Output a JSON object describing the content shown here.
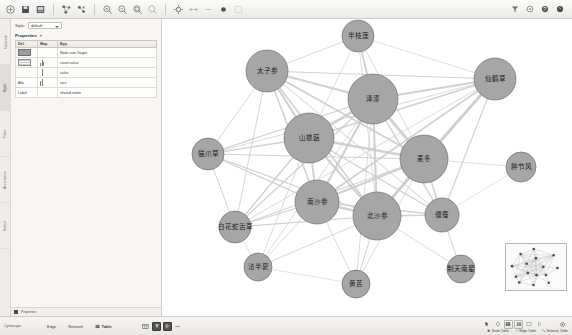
{
  "app": {
    "title": "Cytoscape Network View",
    "background": "#ffffff",
    "node_fill": "#a6a6a6",
    "node_stroke": "#6f6f6f",
    "edge_color": "#c9c9c9"
  },
  "toolbar": {
    "groups": [
      {
        "name": "file",
        "buttons": [
          {
            "icon": "open-network-icon",
            "label": "Open"
          },
          {
            "icon": "save-session-icon",
            "label": "Save Session"
          },
          {
            "icon": "export-image-icon",
            "label": "Export Image"
          }
        ]
      },
      {
        "name": "layout",
        "buttons": [
          {
            "icon": "apply-layout-icon",
            "label": "Apply Layout"
          },
          {
            "icon": "layout-settings-icon",
            "label": "Layout Settings"
          }
        ]
      },
      {
        "name": "zoom",
        "buttons": [
          {
            "icon": "zoom-in-icon",
            "label": "Zoom In"
          },
          {
            "icon": "zoom-out-icon",
            "label": "Zoom Out"
          },
          {
            "icon": "zoom-fit-icon",
            "label": "Fit Network"
          },
          {
            "icon": "zoom-selected-icon",
            "label": "Zoom Selected"
          }
        ]
      },
      {
        "name": "select",
        "buttons": [
          {
            "icon": "select-mode-icon",
            "label": "Select Mode"
          },
          {
            "icon": "hide-selected-icon",
            "label": "Hide Selected"
          },
          {
            "icon": "show-all-icon",
            "label": "Show All"
          },
          {
            "icon": "delete-selected-icon",
            "label": "Delete Selected"
          },
          {
            "icon": "group-nodes-icon",
            "label": "Group Nodes"
          }
        ]
      }
    ],
    "right_buttons": [
      {
        "icon": "filter-icon",
        "label": "Filter"
      },
      {
        "icon": "annotation-icon",
        "label": "Annotation"
      },
      {
        "icon": "help-icon",
        "label": "Help"
      },
      {
        "icon": "app-store-icon",
        "label": "App Store"
      }
    ]
  },
  "left_panel": {
    "vertical_tabs": [
      {
        "label": "Network",
        "selected": false
      },
      {
        "label": "Style",
        "selected": true
      },
      {
        "label": "Filter",
        "selected": false
      },
      {
        "label": "Annotation",
        "selected": false
      },
      {
        "label": "Select",
        "selected": false
      }
    ],
    "style_selector": {
      "label": "Style:",
      "value": "default"
    },
    "properties_label": "Properties",
    "columns": [
      "Def.",
      "Map.",
      "Byp."
    ],
    "rows": [
      {
        "property": "Fill Color",
        "def_kind": "fill",
        "map": "",
        "byp": "",
        "map_text": "Node.size.Target"
      },
      {
        "property": "Shape",
        "def_kind": "stripe",
        "map": "chart",
        "byp": "",
        "map_text": "count.value"
      },
      {
        "property": "Size",
        "def_kind": "none",
        "map": "bar",
        "byp": "",
        "map_text": "value"
      },
      {
        "property": "Label Font",
        "def_kind": "text",
        "map": "chart",
        "byp": "",
        "map_text": "size",
        "def_text": "Abc"
      },
      {
        "property": "Label",
        "def_kind": "text",
        "map": "",
        "byp": "",
        "map_text": "shared name",
        "def_text": "Label"
      }
    ],
    "footer_label": "Properties"
  },
  "network": {
    "nodes": [
      {
        "id": "n1",
        "label": "半枝莲",
        "x": 196,
        "y": 17,
        "r": 16
      },
      {
        "id": "n2",
        "label": "太子参",
        "x": 105,
        "y": 52,
        "r": 21
      },
      {
        "id": "n3",
        "label": "仙鹤草",
        "x": 333,
        "y": 60,
        "r": 21
      },
      {
        "id": "n4",
        "label": "泽漆",
        "x": 211,
        "y": 80,
        "r": 25
      },
      {
        "id": "n5",
        "label": "山慈菇",
        "x": 147,
        "y": 119,
        "r": 25
      },
      {
        "id": "n6",
        "label": "麦冬",
        "x": 262,
        "y": 140,
        "r": 24
      },
      {
        "id": "n7",
        "label": "猫爪草",
        "x": 46,
        "y": 135,
        "r": 16
      },
      {
        "id": "n8",
        "label": "肿节风",
        "x": 359,
        "y": 148,
        "r": 15
      },
      {
        "id": "n9",
        "label": "南沙参",
        "x": 155,
        "y": 183,
        "r": 22
      },
      {
        "id": "n10",
        "label": "北沙参",
        "x": 215,
        "y": 197,
        "r": 24
      },
      {
        "id": "n11",
        "label": "僵蚕",
        "x": 280,
        "y": 196,
        "r": 17
      },
      {
        "id": "n12",
        "label": "白花蛇舌草",
        "x": 73,
        "y": 208,
        "r": 16
      },
      {
        "id": "n13",
        "label": "法半夏",
        "x": 96,
        "y": 248,
        "r": 14
      },
      {
        "id": "n14",
        "label": "黄芪",
        "x": 194,
        "y": 265,
        "r": 14
      },
      {
        "id": "n15",
        "label": "制天南星",
        "x": 299,
        "y": 250,
        "r": 14
      }
    ],
    "edges": [
      {
        "source": "n1",
        "target": "n4",
        "w": 1.8
      },
      {
        "source": "n1",
        "target": "n2",
        "w": 0.8
      },
      {
        "source": "n1",
        "target": "n3",
        "w": 0.7
      },
      {
        "source": "n1",
        "target": "n5",
        "w": 0.7
      },
      {
        "source": "n1",
        "target": "n6",
        "w": 0.8
      },
      {
        "source": "n1",
        "target": "n10",
        "w": 0.7
      },
      {
        "source": "n2",
        "target": "n3",
        "w": 1.0
      },
      {
        "source": "n2",
        "target": "n4",
        "w": 2.2
      },
      {
        "source": "n2",
        "target": "n5",
        "w": 2.2
      },
      {
        "source": "n2",
        "target": "n6",
        "w": 2.0
      },
      {
        "source": "n2",
        "target": "n7",
        "w": 0.9
      },
      {
        "source": "n2",
        "target": "n9",
        "w": 1.6
      },
      {
        "source": "n2",
        "target": "n10",
        "w": 1.6
      },
      {
        "source": "n2",
        "target": "n11",
        "w": 1.0
      },
      {
        "source": "n2",
        "target": "n12",
        "w": 0.9
      },
      {
        "source": "n3",
        "target": "n4",
        "w": 2.2
      },
      {
        "source": "n3",
        "target": "n5",
        "w": 1.8
      },
      {
        "source": "n3",
        "target": "n6",
        "w": 2.6
      },
      {
        "source": "n3",
        "target": "n9",
        "w": 1.6
      },
      {
        "source": "n3",
        "target": "n10",
        "w": 1.6
      },
      {
        "source": "n3",
        "target": "n11",
        "w": 1.2
      },
      {
        "source": "n3",
        "target": "n7",
        "w": 0.8
      },
      {
        "source": "n3",
        "target": "n12",
        "w": 0.8
      },
      {
        "source": "n4",
        "target": "n5",
        "w": 2.6
      },
      {
        "source": "n4",
        "target": "n6",
        "w": 2.8
      },
      {
        "source": "n4",
        "target": "n7",
        "w": 1.2
      },
      {
        "source": "n4",
        "target": "n9",
        "w": 2.2
      },
      {
        "source": "n4",
        "target": "n10",
        "w": 2.2
      },
      {
        "source": "n4",
        "target": "n11",
        "w": 1.4
      },
      {
        "source": "n4",
        "target": "n12",
        "w": 1.2
      },
      {
        "source": "n4",
        "target": "n13",
        "w": 0.8
      },
      {
        "source": "n4",
        "target": "n14",
        "w": 0.8
      },
      {
        "source": "n5",
        "target": "n6",
        "w": 2.4
      },
      {
        "source": "n5",
        "target": "n7",
        "w": 1.4
      },
      {
        "source": "n5",
        "target": "n9",
        "w": 2.0
      },
      {
        "source": "n5",
        "target": "n10",
        "w": 2.0
      },
      {
        "source": "n5",
        "target": "n11",
        "w": 1.4
      },
      {
        "source": "n5",
        "target": "n12",
        "w": 1.4
      },
      {
        "source": "n5",
        "target": "n13",
        "w": 0.8
      },
      {
        "source": "n6",
        "target": "n8",
        "w": 0.7
      },
      {
        "source": "n6",
        "target": "n9",
        "w": 2.2
      },
      {
        "source": "n6",
        "target": "n10",
        "w": 2.4
      },
      {
        "source": "n6",
        "target": "n11",
        "w": 1.6
      },
      {
        "source": "n6",
        "target": "n7",
        "w": 1.0
      },
      {
        "source": "n6",
        "target": "n12",
        "w": 1.0
      },
      {
        "source": "n6",
        "target": "n14",
        "w": 0.8
      },
      {
        "source": "n7",
        "target": "n9",
        "w": 1.2
      },
      {
        "source": "n7",
        "target": "n10",
        "w": 1.2
      },
      {
        "source": "n7",
        "target": "n12",
        "w": 1.0
      },
      {
        "source": "n9",
        "target": "n10",
        "w": 2.4
      },
      {
        "source": "n9",
        "target": "n11",
        "w": 1.4
      },
      {
        "source": "n9",
        "target": "n12",
        "w": 1.2
      },
      {
        "source": "n9",
        "target": "n13",
        "w": 0.8
      },
      {
        "source": "n9",
        "target": "n14",
        "w": 0.8
      },
      {
        "source": "n10",
        "target": "n11",
        "w": 1.6
      },
      {
        "source": "n10",
        "target": "n12",
        "w": 1.2
      },
      {
        "source": "n10",
        "target": "n13",
        "w": 0.9
      },
      {
        "source": "n10",
        "target": "n14",
        "w": 1.0
      },
      {
        "source": "n10",
        "target": "n15",
        "w": 0.8
      },
      {
        "source": "n11",
        "target": "n15",
        "w": 1.0
      },
      {
        "source": "n11",
        "target": "n8",
        "w": 0.6
      },
      {
        "source": "n12",
        "target": "n13",
        "w": 0.7
      },
      {
        "source": "n13",
        "target": "n14",
        "w": 0.6
      }
    ]
  },
  "birdseye": {
    "name": "network-overview"
  },
  "bottom_bar": {
    "status": "Cytoscape",
    "table_tabs": [
      {
        "label": "Edge",
        "selected": false
      },
      {
        "label": "Network",
        "selected": false
      },
      {
        "label": "Table",
        "selected": true
      }
    ],
    "table_buttons": [
      {
        "icon": "grid-view-icon",
        "label": "Grid"
      },
      {
        "icon": "filter-table-icon",
        "label": "Filter Table"
      },
      {
        "icon": "settings-table-icon",
        "label": "Table Settings"
      },
      {
        "icon": "collapse-icon",
        "label": "Collapse"
      }
    ],
    "right_tools": [
      {
        "icon": "arrow-cursor-icon",
        "label": "Select"
      },
      {
        "icon": "node-shape-icon",
        "label": "Node"
      },
      {
        "icon": "node-table-icon",
        "label": "Node Table"
      },
      {
        "icon": "edge-table-icon",
        "label": "Edge Table"
      },
      {
        "icon": "network-table-icon",
        "label": "Network Table"
      },
      {
        "icon": "pointer-icon",
        "label": "Pointer"
      },
      {
        "icon": "target-icon",
        "label": "Target"
      }
    ],
    "right_labels": [
      {
        "label": "Node Table"
      },
      {
        "label": "Edge Table"
      },
      {
        "label": "Network Table"
      }
    ]
  }
}
